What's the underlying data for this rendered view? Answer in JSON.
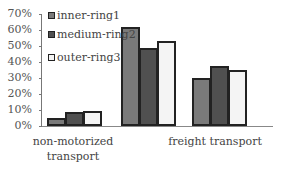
{
  "chart_data": {
    "type": "bar",
    "title": "",
    "xlabel": "",
    "ylabel": "",
    "categories": [
      "non-motorized transport",
      "freight transport"
    ],
    "series": [
      {
        "name": "inner-ring1",
        "color": "#7a7a7a",
        "values": [
          5,
          62
        ]
      },
      {
        "name": "medium-ring2",
        "color": "#505050",
        "values": [
          9,
          49
        ]
      },
      {
        "name": "outer-ring3",
        "color": "#f4f4f4",
        "values": [
          9.5,
          53
        ]
      }
    ],
    "ylim": [
      0,
      70
    ],
    "yticks": [
      "0%",
      "10%",
      "20%",
      "30%",
      "40%",
      "50%",
      "60%",
      "70%"
    ],
    "legend_position": "upper-left",
    "grid": false
  },
  "extra_bars": {
    "note": "third group has no visible label",
    "values": [
      30,
      37.5,
      35
    ]
  },
  "labels": {
    "cat1_line1": "non-motorized",
    "cat1_line2": "transport",
    "cat2": "freight transport"
  }
}
